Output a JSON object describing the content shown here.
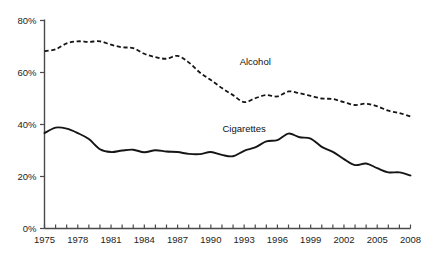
{
  "chart_data": {
    "type": "line",
    "title": "",
    "subtitle": "",
    "xlabel": "",
    "ylabel": "",
    "xlim": [
      1975,
      2008
    ],
    "ylim": [
      0,
      80
    ],
    "grid": false,
    "legend_position": "inline-series-labels",
    "y_ticks": [
      0,
      20,
      40,
      60,
      80
    ],
    "y_tick_labels": [
      "0%",
      "20%",
      "40%",
      "60%",
      "80%"
    ],
    "x": [
      1975,
      1976,
      1977,
      1978,
      1979,
      1980,
      1981,
      1982,
      1983,
      1984,
      1985,
      1986,
      1987,
      1988,
      1989,
      1990,
      1991,
      1992,
      1993,
      1994,
      1995,
      1996,
      1997,
      1998,
      1999,
      2000,
      2001,
      2002,
      2003,
      2004,
      2005,
      2006,
      2007,
      2008
    ],
    "x_tick_labels": [
      "1975",
      "1978",
      "1981",
      "1984",
      "1987",
      "1990",
      "1993",
      "1996",
      "1999",
      "2002",
      "2005",
      "2008"
    ],
    "x_tick_years": [
      1975,
      1978,
      1981,
      1984,
      1987,
      1990,
      1993,
      1996,
      1999,
      2002,
      2005,
      2008
    ],
    "x_minor_ticks_every": 1,
    "series": [
      {
        "name": "Alcohol",
        "style": "dashed",
        "color": "#151515",
        "label_year": 1994,
        "label_value": 63,
        "values": [
          68.2,
          68.9,
          71.2,
          72.0,
          71.8,
          72.0,
          70.7,
          69.7,
          69.4,
          67.2,
          65.9,
          65.3,
          66.4,
          63.9,
          60.0,
          57.1,
          54.0,
          51.3,
          48.6,
          50.1,
          51.3,
          50.8,
          52.7,
          52.0,
          51.0,
          50.0,
          49.8,
          48.6,
          47.5,
          48.0,
          47.0,
          45.3,
          44.4,
          43.1
        ]
      },
      {
        "name": "Cigarettes",
        "style": "solid",
        "color": "#151515",
        "label_year": 1993,
        "label_value": 37,
        "values": [
          36.7,
          38.8,
          38.4,
          36.7,
          34.4,
          30.5,
          29.4,
          30.0,
          30.3,
          29.3,
          30.1,
          29.6,
          29.4,
          28.7,
          28.6,
          29.4,
          28.3,
          27.8,
          29.9,
          31.2,
          33.5,
          34.0,
          36.5,
          35.1,
          34.6,
          31.4,
          29.5,
          26.7,
          24.4,
          25.0,
          23.2,
          21.6,
          21.6,
          20.4
        ]
      }
    ],
    "annotations": [
      {
        "text": "Alcohol",
        "type": "series-label"
      },
      {
        "text": "Cigarettes",
        "type": "series-label"
      }
    ],
    "axis_color": "#4a4a4a"
  }
}
